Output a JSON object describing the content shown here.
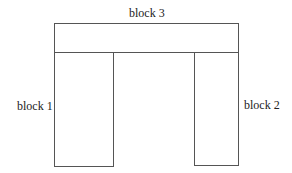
{
  "diagram": {
    "blocks": [
      {
        "id": "block1",
        "label": "block 1"
      },
      {
        "id": "block2",
        "label": "block 2"
      },
      {
        "id": "block3",
        "label": "block 3"
      }
    ],
    "line_color": "#555555"
  }
}
